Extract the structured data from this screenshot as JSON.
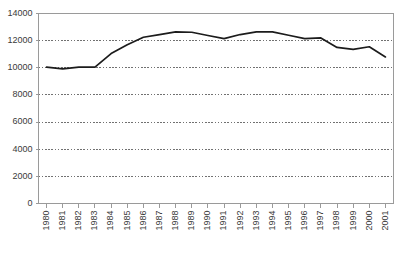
{
  "chart_data": {
    "type": "line",
    "title": "",
    "subtitle": "",
    "xlabel": "",
    "ylabel": "",
    "categories": [
      "1980",
      "1981",
      "1982",
      "1983",
      "1984",
      "1985",
      "1986",
      "1987",
      "1988",
      "1989",
      "1990",
      "1991",
      "1992",
      "1993",
      "1994",
      "1995",
      "1996",
      "1997",
      "1998",
      "1999",
      "2000",
      "2001"
    ],
    "series": [
      {
        "name": "series-1",
        "values": [
          10050,
          9920,
          10050,
          10050,
          11050,
          11700,
          12250,
          12450,
          12650,
          12620,
          12380,
          12150,
          12450,
          12650,
          12650,
          12400,
          12150,
          12200,
          11500,
          11350,
          11550,
          10800
        ]
      }
    ],
    "ylim": [
      0,
      14000
    ],
    "yticks": [
      0,
      2000,
      4000,
      6000,
      8000,
      10000,
      12000,
      14000
    ],
    "ytick_labels": [
      "0",
      "2000",
      "4000",
      "6000",
      "8000",
      "10000",
      "12000",
      "14000"
    ],
    "grid": true,
    "grid_axis": "y",
    "grid_style": "dotted",
    "legend": false,
    "legend_position": "none",
    "line_color": "#1c1c1c",
    "grid_color": "#4d4d4d",
    "axis_color": "#9a9a9a",
    "background_color": "#ffffff",
    "xtick_label_rotation": -90
  },
  "axes": {
    "y_axis_name": "value-axis",
    "x_axis_name": "year-axis"
  }
}
